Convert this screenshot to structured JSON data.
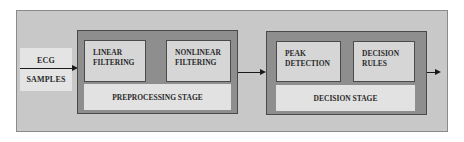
{
  "diagram": {
    "input": {
      "line1": "ECG",
      "line2": "SAMPLES"
    },
    "stages": [
      {
        "name": "PREPROCESSING STAGE",
        "blocks": [
          {
            "line1": "LINEAR",
            "line2": "FILTERING"
          },
          {
            "line1": "NONLINEAR",
            "line2": "FILTERING"
          }
        ]
      },
      {
        "name": "DECISION STAGE",
        "blocks": [
          {
            "line1": "PEAK",
            "line2": "DETECTION"
          },
          {
            "line1": "DECISION",
            "line2": "RULES"
          }
        ]
      }
    ],
    "connections": [
      {
        "from": "ECG SAMPLES",
        "to": "PREPROCESSING STAGE"
      },
      {
        "from": "PREPROCESSING STAGE",
        "to": "DECISION STAGE"
      },
      {
        "from": "DECISION STAGE",
        "to": "output"
      }
    ],
    "colors": {
      "outer_frame": "#c8c8c8",
      "stage_fill": "#8e8e8e",
      "block_fill": "#d6d6d6",
      "band_fill": "#e2e2e2",
      "input_fill": "#e4e4e4",
      "text": "#2a2a2a"
    }
  }
}
